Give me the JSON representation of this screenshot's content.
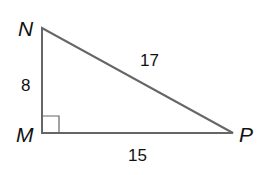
{
  "diagram": {
    "type": "right-triangle",
    "vertices": {
      "N": {
        "label": "N",
        "x": 42,
        "y": 28
      },
      "M": {
        "label": "M",
        "x": 42,
        "y": 133
      },
      "P": {
        "label": "P",
        "x": 233,
        "y": 133
      }
    },
    "sides": {
      "NM": {
        "label": "8"
      },
      "MP": {
        "label": "15"
      },
      "NP": {
        "label": "17"
      }
    },
    "right_angle_at": "M",
    "colors": {
      "line": "#666666",
      "text": "#111111"
    }
  }
}
